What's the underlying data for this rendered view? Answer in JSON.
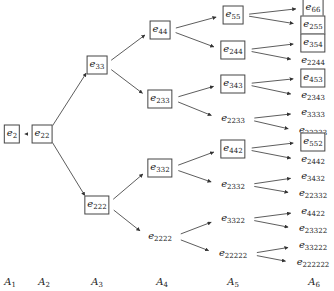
{
  "diagram": {
    "title": "",
    "levels": [
      {
        "id": "A1",
        "base": "A",
        "sub": "1",
        "x": 10,
        "y": 282
      },
      {
        "id": "A2",
        "base": "A",
        "sub": "2",
        "x": 44,
        "y": 282
      },
      {
        "id": "A3",
        "base": "A",
        "sub": "3",
        "x": 97,
        "y": 282
      },
      {
        "id": "A4",
        "base": "A",
        "sub": "4",
        "x": 162,
        "y": 282
      },
      {
        "id": "A5",
        "base": "A",
        "sub": "5",
        "x": 233,
        "y": 282
      },
      {
        "id": "A6",
        "base": "A",
        "sub": "6",
        "x": 314,
        "y": 282
      }
    ],
    "nodes": [
      {
        "id": "e2",
        "base": "e",
        "sub": "2",
        "boxed": true,
        "x": 12,
        "y": 134
      },
      {
        "id": "e22",
        "base": "e",
        "sub": "22",
        "boxed": true,
        "x": 42,
        "y": 134
      },
      {
        "id": "e33",
        "base": "e",
        "sub": "33",
        "boxed": true,
        "x": 97,
        "y": 65
      },
      {
        "id": "e222",
        "base": "e",
        "sub": "222",
        "boxed": true,
        "x": 97,
        "y": 205
      },
      {
        "id": "e44",
        "base": "e",
        "sub": "44",
        "boxed": true,
        "x": 160,
        "y": 30
      },
      {
        "id": "e233",
        "base": "e",
        "sub": "233",
        "boxed": true,
        "x": 160,
        "y": 99
      },
      {
        "id": "e332",
        "base": "e",
        "sub": "332",
        "boxed": true,
        "x": 160,
        "y": 168
      },
      {
        "id": "e2222",
        "base": "e",
        "sub": "2222",
        "boxed": false,
        "x": 160,
        "y": 237
      },
      {
        "id": "e55",
        "base": "e",
        "sub": "55",
        "boxed": true,
        "x": 233,
        "y": 15
      },
      {
        "id": "e244",
        "base": "e",
        "sub": "244",
        "boxed": true,
        "x": 233,
        "y": 50
      },
      {
        "id": "e343",
        "base": "e",
        "sub": "343",
        "boxed": true,
        "x": 233,
        "y": 84
      },
      {
        "id": "e2233",
        "base": "e",
        "sub": "2233",
        "boxed": false,
        "x": 233,
        "y": 119
      },
      {
        "id": "e442",
        "base": "e",
        "sub": "442",
        "boxed": true,
        "x": 233,
        "y": 149
      },
      {
        "id": "e2332",
        "base": "e",
        "sub": "2332",
        "boxed": false,
        "x": 233,
        "y": 185
      },
      {
        "id": "e3322",
        "base": "e",
        "sub": "3322",
        "boxed": false,
        "x": 233,
        "y": 219
      },
      {
        "id": "e22222",
        "base": "e",
        "sub": "22222",
        "boxed": false,
        "x": 233,
        "y": 254
      },
      {
        "id": "e66",
        "base": "e",
        "sub": "66",
        "boxed": true,
        "x": 313,
        "y": 8
      },
      {
        "id": "e255",
        "base": "e",
        "sub": "255",
        "boxed": true,
        "x": 313,
        "y": 25
      },
      {
        "id": "e354",
        "base": "e",
        "sub": "354",
        "boxed": true,
        "x": 313,
        "y": 43
      },
      {
        "id": "e2244",
        "base": "e",
        "sub": "2244",
        "boxed": false,
        "x": 313,
        "y": 61
      },
      {
        "id": "e453",
        "base": "e",
        "sub": "453",
        "boxed": true,
        "x": 313,
        "y": 78
      },
      {
        "id": "e2343",
        "base": "e",
        "sub": "2343",
        "boxed": false,
        "x": 313,
        "y": 96
      },
      {
        "id": "e3333",
        "base": "e",
        "sub": "3333",
        "boxed": false,
        "x": 313,
        "y": 113
      },
      {
        "id": "e22233",
        "base": "e",
        "sub": "22233",
        "boxed": false,
        "x": 313,
        "y": 131
      },
      {
        "id": "e552",
        "base": "e",
        "sub": "552",
        "boxed": true,
        "x": 313,
        "y": 142
      },
      {
        "id": "e2442",
        "base": "e",
        "sub": "2442",
        "boxed": false,
        "x": 313,
        "y": 160
      },
      {
        "id": "e3432",
        "base": "e",
        "sub": "3432",
        "boxed": false,
        "x": 313,
        "y": 177
      },
      {
        "id": "e22332",
        "base": "e",
        "sub": "22332",
        "boxed": false,
        "x": 313,
        "y": 194
      },
      {
        "id": "e4422",
        "base": "e",
        "sub": "4422",
        "boxed": false,
        "x": 313,
        "y": 212
      },
      {
        "id": "e23322",
        "base": "e",
        "sub": "23322",
        "boxed": false,
        "x": 313,
        "y": 229
      },
      {
        "id": "e33222",
        "base": "e",
        "sub": "33222",
        "boxed": false,
        "x": 313,
        "y": 246
      },
      {
        "id": "e222222",
        "base": "e",
        "sub": "222222",
        "boxed": false,
        "x": 313,
        "y": 263
      }
    ],
    "edges": [
      [
        "e2",
        "e22"
      ],
      [
        "e22",
        "e33"
      ],
      [
        "e22",
        "e222"
      ],
      [
        "e33",
        "e44"
      ],
      [
        "e33",
        "e233"
      ],
      [
        "e222",
        "e332"
      ],
      [
        "e222",
        "e2222"
      ],
      [
        "e44",
        "e55"
      ],
      [
        "e44",
        "e244"
      ],
      [
        "e233",
        "e343"
      ],
      [
        "e233",
        "e2233"
      ],
      [
        "e332",
        "e442"
      ],
      [
        "e332",
        "e2332"
      ],
      [
        "e2222",
        "e3322"
      ],
      [
        "e2222",
        "e22222"
      ],
      [
        "e55",
        "e66"
      ],
      [
        "e55",
        "e255"
      ],
      [
        "e244",
        "e354"
      ],
      [
        "e244",
        "e2244"
      ],
      [
        "e343",
        "e453"
      ],
      [
        "e343",
        "e2343"
      ],
      [
        "e2233",
        "e3333"
      ],
      [
        "e2233",
        "e22233"
      ],
      [
        "e442",
        "e552"
      ],
      [
        "e442",
        "e2442"
      ],
      [
        "e2332",
        "e3432"
      ],
      [
        "e2332",
        "e22332"
      ],
      [
        "e3322",
        "e4422"
      ],
      [
        "e3322",
        "e23322"
      ],
      [
        "e22222",
        "e33222"
      ],
      [
        "e22222",
        "e222222"
      ]
    ],
    "colors": {
      "stroke": "#333333",
      "text": "#222222",
      "background": "#ffffff"
    }
  }
}
